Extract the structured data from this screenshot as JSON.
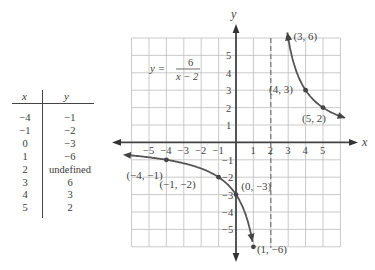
{
  "table": {
    "headers": {
      "x": "x",
      "y": "y"
    },
    "rows": [
      {
        "x": "−4",
        "y": "−1"
      },
      {
        "x": "−1",
        "y": "−2"
      },
      {
        "x": "0",
        "y": "−3"
      },
      {
        "x": "1",
        "y": "−6"
      },
      {
        "x": "2",
        "y": "undefined"
      },
      {
        "x": "3",
        "y": "6"
      },
      {
        "x": "4",
        "y": "3"
      },
      {
        "x": "5",
        "y": "2"
      }
    ]
  },
  "graph": {
    "equation_lhs": "y =",
    "equation_num": "6",
    "equation_den": "x − 2",
    "x_axis_label": "x",
    "y_axis_label": "y",
    "x_ticks": [
      "−5",
      "−4",
      "−3",
      "−2",
      "−1",
      "1",
      "2",
      "3",
      "4",
      "5"
    ],
    "y_ticks": [
      "5",
      "4",
      "3",
      "2",
      "1",
      "−1",
      "−2",
      "−3",
      "−4",
      "−5"
    ],
    "asymptote": "x = 2",
    "points": [
      {
        "label": "(−4, −1)"
      },
      {
        "label": "(−1, −2)"
      },
      {
        "label": "(0, −3)"
      },
      {
        "label": "(1, −6)"
      },
      {
        "label": "(3, 6)"
      },
      {
        "label": "(4, 3)"
      },
      {
        "label": "(5, 2)"
      }
    ]
  },
  "chart_data": {
    "type": "line",
    "xlabel": "x",
    "ylabel": "y",
    "xlim": [
      -6,
      6
    ],
    "ylim": [
      -6,
      6
    ],
    "grid": true,
    "vertical_asymptote": 2,
    "horizontal_asymptote": 0,
    "series": [
      {
        "name": "left branch",
        "x": [
          -4,
          -1,
          0,
          1
        ],
        "y": [
          -1,
          -2,
          -3,
          -6
        ]
      },
      {
        "name": "right branch",
        "x": [
          3,
          4,
          5
        ],
        "y": [
          6,
          3,
          2
        ]
      }
    ],
    "table": {
      "x": [
        -4,
        -1,
        0,
        1,
        2,
        3,
        4,
        5
      ],
      "y": [
        -1,
        -2,
        -3,
        -6,
        "undefined",
        6,
        3,
        2
      ]
    }
  }
}
